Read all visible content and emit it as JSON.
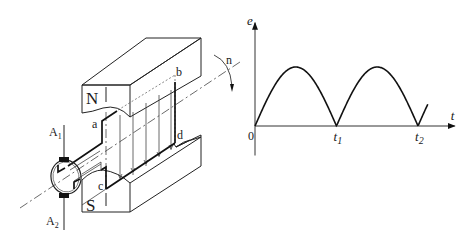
{
  "figure": {
    "left_panel": {
      "title": "DC generator principle: armature coil rotating between magnet poles",
      "labels": {
        "north_pole": "N",
        "south_pole": "S",
        "corner_a": "a",
        "corner_b": "b",
        "corner_c": "c",
        "corner_d": "d",
        "speed": "n",
        "brush_1_main": "A",
        "brush_1_sub": "1",
        "brush_2_main": "A",
        "brush_2_sub": "2"
      }
    },
    "right_panel": {
      "title": "Rectified EMF waveform"
    }
  },
  "chart_data": {
    "type": "line",
    "title": "",
    "xlabel": "t",
    "ylabel": "e",
    "origin_label": "0",
    "x_ticks": [
      {
        "main": "t",
        "sub": "1",
        "value": 1
      },
      {
        "main": "t",
        "sub": "2",
        "value": 2
      }
    ],
    "xlim": [
      0,
      2.45
    ],
    "ylim": [
      -0.5,
      1.75
    ],
    "grid": false,
    "legend": "none",
    "series": [
      {
        "name": "e(t) = |sin(pi t)|",
        "function": "abs_sin",
        "x_range": [
          0,
          2.12
        ],
        "amplitude": 1
      }
    ]
  }
}
